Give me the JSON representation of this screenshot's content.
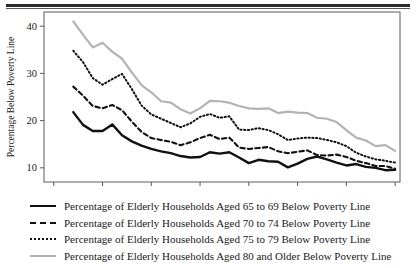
{
  "figure": {
    "top_rule": "horizontal-rule"
  },
  "chart_data": {
    "type": "line",
    "title": "",
    "xlabel": "",
    "ylabel": "Percentage Below Poverty Line",
    "xlim": [
      1964,
      2000.5
    ],
    "ylim": [
      7,
      43
    ],
    "grid": false,
    "legend_position": "below",
    "xticks": [
      1965,
      1970,
      1975,
      1980,
      1985,
      1990,
      1995,
      2000
    ],
    "xtick_labels": [
      "1965",
      "1970",
      "1975",
      "1980",
      "1985",
      "1990",
      "1995",
      "2000"
    ],
    "yticks": [
      10,
      20,
      30,
      40
    ],
    "ytick_labels": [
      "10",
      "20",
      "30",
      "40"
    ],
    "x": [
      1967,
      1968,
      1969,
      1970,
      1971,
      1972,
      1973,
      1974,
      1975,
      1976,
      1977,
      1978,
      1979,
      1980,
      1981,
      1982,
      1983,
      1984,
      1985,
      1986,
      1987,
      1988,
      1989,
      1990,
      1991,
      1992,
      1993,
      1994,
      1995,
      1996,
      1997,
      1998,
      1999,
      2000
    ],
    "series": [
      {
        "name": "Percentage of Elderly Households Aged 65 to 69 Below Poverty Line",
        "style": "solid",
        "color": "#111111",
        "width": 2.4,
        "values": [
          21.8,
          19.1,
          17.8,
          17.8,
          19.2,
          16.9,
          15.6,
          14.7,
          14.0,
          13.5,
          13.1,
          12.5,
          12.2,
          12.3,
          13.3,
          13.0,
          13.3,
          12.2,
          11.0,
          11.7,
          11.4,
          11.3,
          10.1,
          10.9,
          11.9,
          12.4,
          11.8,
          11.1,
          10.5,
          10.8,
          10.2,
          10.0,
          9.5,
          9.6
        ]
      },
      {
        "name": "Percentage of Elderly Households Aged 70 to 74 Below Poverty Line",
        "style": "dashed",
        "color": "#111111",
        "width": 2.1,
        "values": [
          27.2,
          25.3,
          23.1,
          22.6,
          23.3,
          22.2,
          19.8,
          17.6,
          16.3,
          15.9,
          15.5,
          14.8,
          15.4,
          16.3,
          17.0,
          16.1,
          16.4,
          14.3,
          14.0,
          14.2,
          14.4,
          13.5,
          13.1,
          13.4,
          13.7,
          12.7,
          12.6,
          12.8,
          12.3,
          11.5,
          11.0,
          10.4,
          10.4,
          9.8
        ]
      },
      {
        "name": "Percentage of Elderly Households Aged 75 to 79 Below Poverty Line",
        "style": "dotted",
        "color": "#111111",
        "width": 2.0,
        "values": [
          34.8,
          32.4,
          29.0,
          27.6,
          28.8,
          29.9,
          26.7,
          23.2,
          21.3,
          20.4,
          19.5,
          18.6,
          19.4,
          20.8,
          21.4,
          20.6,
          20.9,
          18.1,
          18.0,
          18.4,
          18.0,
          17.1,
          15.9,
          16.2,
          16.4,
          16.3,
          15.9,
          15.4,
          14.6,
          13.2,
          12.4,
          11.8,
          11.5,
          11.1
        ]
      },
      {
        "name": "Percentage of Elderly Households Aged 80 and Older Below Poverty Line",
        "style": "solid",
        "color": "#b3b3b3",
        "width": 2.2,
        "values": [
          41.0,
          38.2,
          35.5,
          36.5,
          34.6,
          33.1,
          30.2,
          27.5,
          26.0,
          24.1,
          23.8,
          22.4,
          21.5,
          22.6,
          24.2,
          24.1,
          23.8,
          23.1,
          22.6,
          22.5,
          22.6,
          21.6,
          21.9,
          21.7,
          21.6,
          20.6,
          20.4,
          19.7,
          18.0,
          16.4,
          15.8,
          14.6,
          14.8,
          13.6
        ]
      }
    ]
  },
  "legend": {
    "items": [
      {
        "swatch": "solid-black-line-swatch",
        "label": "Percentage of Elderly Households Aged 65 to 69 Below Poverty Line"
      },
      {
        "swatch": "dashed-black-line-swatch",
        "label": "Percentage of Elderly Households Aged 70 to 74 Below Poverty Line"
      },
      {
        "swatch": "dotted-black-line-swatch",
        "label": "Percentage of Elderly Households Aged 75 to 79 Below Poverty Line"
      },
      {
        "swatch": "solid-gray-line-swatch",
        "label": "Percentage of Elderly Households Aged 80 and Older Below Poverty Line"
      }
    ]
  }
}
